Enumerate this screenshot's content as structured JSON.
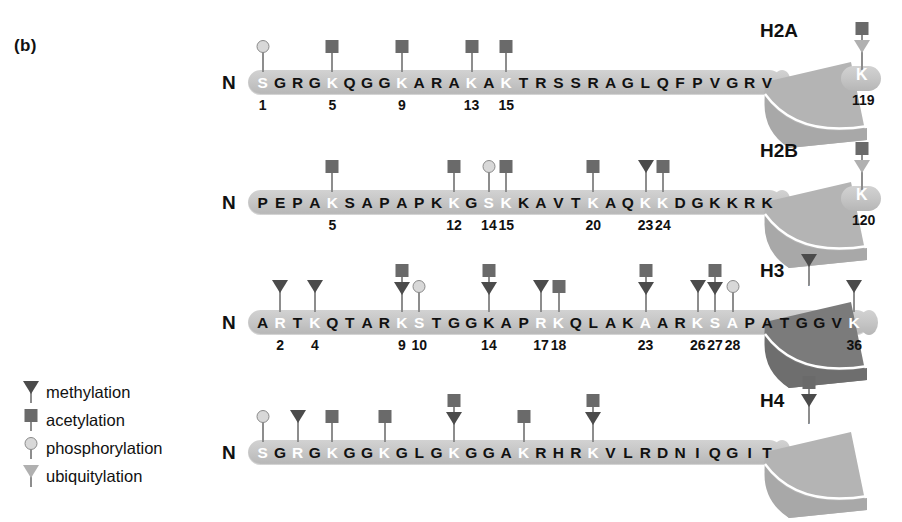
{
  "panel": {
    "label": "(b)"
  },
  "legend": {
    "items": [
      {
        "name": "methylation",
        "glyph": "triangle-dark",
        "label": "methylation"
      },
      {
        "name": "acetylation",
        "glyph": "square-dark",
        "label": "acetylation"
      },
      {
        "name": "phosphorylation",
        "glyph": "circle-light",
        "label": "phosphorylation"
      },
      {
        "name": "ubiquitylation",
        "glyph": "triangle-light",
        "label": "ubiquitylation"
      }
    ]
  },
  "nterm_label": "N",
  "histones": [
    {
      "id": "H2A",
      "name": "H2A",
      "sequence": "SGRGKQGGKARAKAKTRSSRAGLQFPVGRV",
      "highlighted": [
        1,
        5,
        9,
        13,
        15
      ],
      "numbers": [
        {
          "pos": 1,
          "text": "1"
        },
        {
          "pos": 5,
          "text": "5"
        },
        {
          "pos": 9,
          "text": "9"
        },
        {
          "pos": 13,
          "text": "13"
        },
        {
          "pos": 15,
          "text": "15"
        }
      ],
      "mods": [
        {
          "pos": 1,
          "glyphs": [
            "circle-light"
          ],
          "residue": "S1",
          "type": "phosphorylation"
        },
        {
          "pos": 5,
          "glyphs": [
            "square-dark"
          ],
          "residue": "K5",
          "type": "acetylation"
        },
        {
          "pos": 9,
          "glyphs": [
            "square-dark"
          ],
          "residue": "K9",
          "type": "acetylation"
        },
        {
          "pos": 13,
          "glyphs": [
            "square-dark"
          ],
          "residue": "K13",
          "type": "acetylation"
        },
        {
          "pos": 15,
          "glyphs": [
            "square-dark"
          ],
          "residue": "K15",
          "type": "acetylation"
        }
      ],
      "core": {
        "residue": "K",
        "number": "119",
        "number_color": "dark",
        "shade": "light",
        "glyphs": [
          "square-dark",
          "triangle-light"
        ]
      }
    },
    {
      "id": "H2B",
      "name": "H2B",
      "sequence": "PEPAKSAPAPKKGSKKAVTKAQKKDGKKRK",
      "highlighted": [
        5,
        12,
        14,
        15,
        20,
        23,
        24
      ],
      "numbers": [
        {
          "pos": 5,
          "text": "5"
        },
        {
          "pos": 12,
          "text": "12"
        },
        {
          "pos": 14,
          "text": "14"
        },
        {
          "pos": 15,
          "text": "15"
        },
        {
          "pos": 20,
          "text": "20"
        },
        {
          "pos": 23,
          "text": "23"
        },
        {
          "pos": 24,
          "text": "24"
        }
      ],
      "mods": [
        {
          "pos": 5,
          "glyphs": [
            "square-dark"
          ],
          "residue": "K5",
          "type": "acetylation"
        },
        {
          "pos": 12,
          "glyphs": [
            "square-dark"
          ],
          "residue": "K12",
          "type": "acetylation"
        },
        {
          "pos": 14,
          "glyphs": [
            "circle-light"
          ],
          "residue": "S14",
          "type": "phosphorylation"
        },
        {
          "pos": 15,
          "glyphs": [
            "square-dark"
          ],
          "residue": "K15",
          "type": "acetylation"
        },
        {
          "pos": 20,
          "glyphs": [
            "square-dark"
          ],
          "residue": "K20",
          "type": "acetylation"
        },
        {
          "pos": 23,
          "glyphs": [
            "triangle-dark"
          ],
          "residue": "K23",
          "type": "methylation"
        },
        {
          "pos": 24,
          "glyphs": [
            "square-dark"
          ],
          "residue": "K24",
          "type": "acetylation"
        }
      ],
      "core": {
        "residue": "K",
        "number": "120",
        "number_color": "dark",
        "shade": "light",
        "glyphs": [
          "square-dark",
          "triangle-light"
        ]
      }
    },
    {
      "id": "H3",
      "name": "H3",
      "sequence": "ARTKQTARKSTGGKAPRKQLAKAARKSAPATGGVK",
      "highlighted": [
        2,
        4,
        9,
        10,
        17,
        18,
        23,
        26,
        27,
        28,
        35
      ],
      "numbers": [
        {
          "pos": 2,
          "text": "2"
        },
        {
          "pos": 4,
          "text": "4"
        },
        {
          "pos": 9,
          "text": "9"
        },
        {
          "pos": 10,
          "text": "10"
        },
        {
          "pos": 14,
          "text": "14"
        },
        {
          "pos": 17,
          "text": "17"
        },
        {
          "pos": 18,
          "text": "18"
        },
        {
          "pos": 23,
          "text": "23"
        },
        {
          "pos": 26,
          "text": "26"
        },
        {
          "pos": 27,
          "text": "27"
        },
        {
          "pos": 28,
          "text": "28"
        },
        {
          "pos": 35,
          "text": "36"
        }
      ],
      "mods": [
        {
          "pos": 2,
          "glyphs": [
            "triangle-dark"
          ],
          "residue": "R2",
          "type": "methylation"
        },
        {
          "pos": 4,
          "glyphs": [
            "triangle-dark"
          ],
          "residue": "K4",
          "type": "methylation"
        },
        {
          "pos": 9,
          "glyphs": [
            "square-dark",
            "triangle-dark"
          ],
          "residue": "K9",
          "type": "acetylation + methylation"
        },
        {
          "pos": 10,
          "glyphs": [
            "circle-light"
          ],
          "residue": "S10",
          "type": "phosphorylation"
        },
        {
          "pos": 14,
          "glyphs": [
            "square-dark",
            "triangle-dark"
          ],
          "residue": "K14",
          "type": "acetylation + methylation"
        },
        {
          "pos": 17,
          "glyphs": [
            "triangle-dark"
          ],
          "residue": "R17",
          "type": "methylation"
        },
        {
          "pos": 18,
          "glyphs": [
            "square-dark"
          ],
          "residue": "K18",
          "type": "acetylation"
        },
        {
          "pos": 23,
          "glyphs": [
            "square-dark",
            "triangle-dark"
          ],
          "residue": "K23",
          "type": "acetylation + methylation"
        },
        {
          "pos": 26,
          "glyphs": [
            "triangle-dark"
          ],
          "residue": "R26",
          "type": "methylation"
        },
        {
          "pos": 27,
          "glyphs": [
            "square-dark",
            "triangle-dark"
          ],
          "residue": "K27",
          "type": "acetylation + methylation"
        },
        {
          "pos": 28,
          "glyphs": [
            "circle-light"
          ],
          "residue": "S28",
          "type": "phosphorylation"
        },
        {
          "pos": 35,
          "glyphs": [
            "triangle-dark"
          ],
          "residue": "K36",
          "type": "methylation"
        }
      ],
      "core": {
        "residue": "K",
        "number": "79",
        "number_color": "light",
        "shade": "dark",
        "glyphs": [
          "triangle-dark"
        ]
      }
    },
    {
      "id": "H4",
      "name": "H4",
      "sequence": "SGRGKGGKGLGKGGAKRHRKVLRDNIQGIT",
      "highlighted": [
        1,
        3,
        5,
        8,
        12,
        16,
        20
      ],
      "numbers": [],
      "mods": [
        {
          "pos": 1,
          "glyphs": [
            "circle-light"
          ],
          "residue": "S1",
          "type": "phosphorylation"
        },
        {
          "pos": 3,
          "glyphs": [
            "triangle-dark"
          ],
          "residue": "R3",
          "type": "methylation"
        },
        {
          "pos": 5,
          "glyphs": [
            "square-dark"
          ],
          "residue": "K5",
          "type": "acetylation"
        },
        {
          "pos": 8,
          "glyphs": [
            "square-dark"
          ],
          "residue": "K8",
          "type": "acetylation"
        },
        {
          "pos": 12,
          "glyphs": [
            "square-dark",
            "triangle-dark"
          ],
          "residue": "K12",
          "type": "acetylation + methylation"
        },
        {
          "pos": 16,
          "glyphs": [
            "square-dark"
          ],
          "residue": "K16",
          "type": "acetylation"
        },
        {
          "pos": 20,
          "glyphs": [
            "square-dark",
            "triangle-dark"
          ],
          "residue": "K20",
          "type": "acetylation + methylation"
        }
      ],
      "core": {
        "residue": "K",
        "number": "79",
        "number_color": "light",
        "shade": "light",
        "glyphs": [
          "square-dark",
          "triangle-dark"
        ]
      }
    }
  ],
  "colors": {
    "tail": "#c6c6c6",
    "glob_light": "#b4b4b4",
    "glob_dark": "#7b7b7b",
    "mark_dark": "#4b4b4b",
    "mark_square": "#6a6a6a",
    "mark_light": "#b0b0b0",
    "circle": "#d8d8d8",
    "text": "#111111",
    "highlight_text": "#ffffff"
  }
}
